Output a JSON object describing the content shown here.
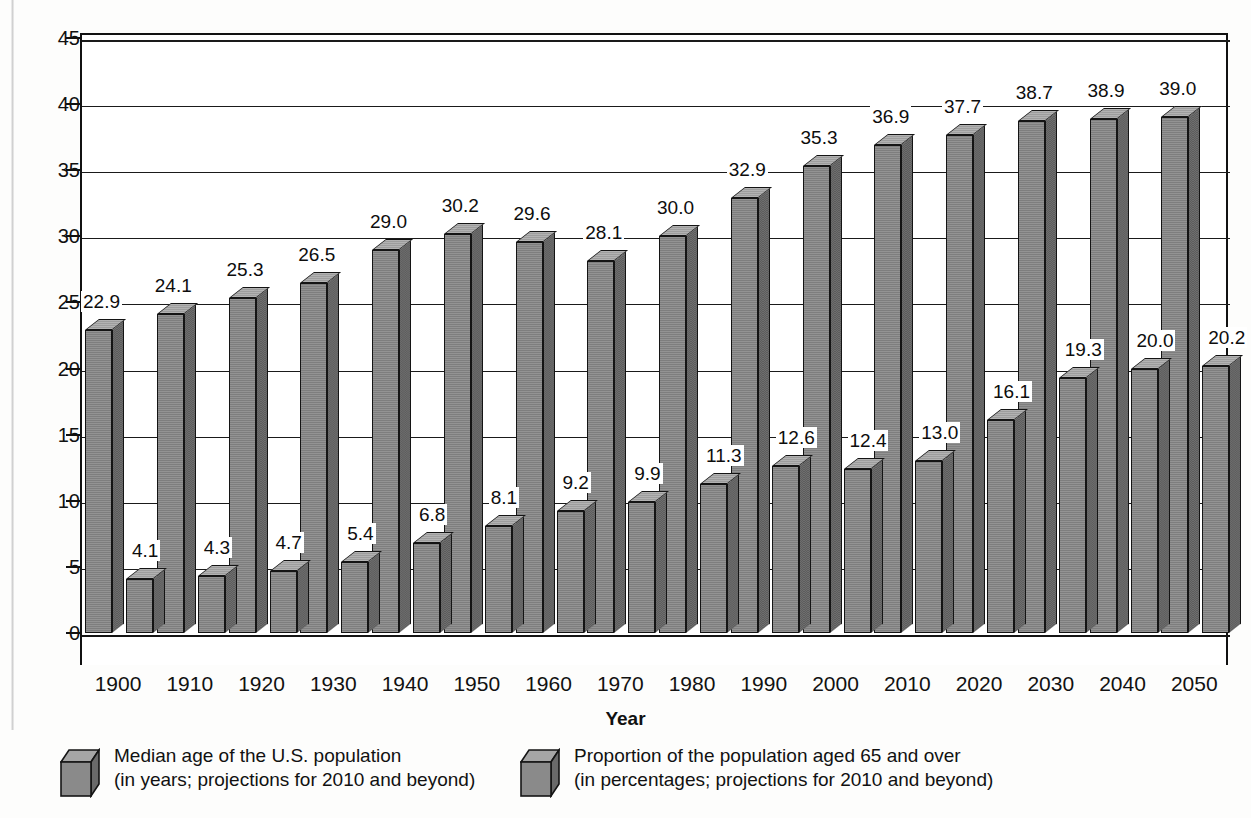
{
  "chart_data": {
    "type": "bar",
    "title": "",
    "xlabel": "Year",
    "ylabel": "",
    "ylim": [
      0,
      45
    ],
    "yticks": [
      "0",
      "5",
      "10",
      "15",
      "20",
      "25",
      "30",
      "35",
      "40",
      "45"
    ],
    "grid": true,
    "legend_position": "bottom",
    "categories": [
      "1900",
      "1910",
      "1920",
      "1930",
      "1940",
      "1950",
      "1960",
      "1970",
      "1980",
      "1990",
      "2000",
      "2010",
      "2020",
      "2030",
      "2040",
      "2050"
    ],
    "series": [
      {
        "name": "Median age of the U.S. population",
        "sublabel": "(in years; projections for 2010 and beyond)",
        "values": [
          22.9,
          24.1,
          25.3,
          26.5,
          29.0,
          30.2,
          29.6,
          28.1,
          30.0,
          32.9,
          35.3,
          36.9,
          37.7,
          38.7,
          38.9,
          39.0
        ],
        "labels": [
          "22.9",
          "24.1",
          "25.3",
          "26.5",
          "29.0",
          "30.2",
          "29.6",
          "28.1",
          "30.0",
          "32.9",
          "35.3",
          "36.9",
          "37.7",
          "38.7",
          "38.9",
          "39.0"
        ]
      },
      {
        "name": "Proportion of the population aged 65 and over",
        "sublabel": "(in percentages; projections for 2010 and beyond)",
        "values": [
          4.1,
          4.3,
          4.7,
          5.4,
          6.8,
          8.1,
          9.2,
          9.9,
          11.3,
          12.6,
          12.4,
          13.0,
          16.1,
          19.3,
          20.0,
          20.2
        ],
        "labels": [
          "4.1",
          "4.3",
          "4.7",
          "5.4",
          "6.8",
          "8.1",
          "9.2",
          "9.9",
          "11.3",
          "12.6",
          "12.4",
          "13.0",
          "16.1",
          "19.3",
          "20.0",
          "20.2"
        ]
      }
    ]
  },
  "axis": {
    "x_title": "Year"
  },
  "legend": {
    "items": [
      {
        "line1": "Median age of the U.S. population",
        "line2": "(in years; projections for 2010 and beyond)"
      },
      {
        "line1": "Proportion of the population aged 65 and over",
        "line2": "(in percentages; projections for 2010 and beyond)"
      }
    ]
  },
  "colors": {
    "bar_front": "#7e7e7e",
    "bar_side": "#5d5d5d",
    "bar_top": "#9d9d9d",
    "outline": "#141414",
    "text": "#111111",
    "background": "#fdfdfc"
  }
}
